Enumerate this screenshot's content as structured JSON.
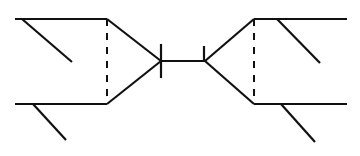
{
  "canvas": {
    "width": 360,
    "height": 156,
    "background": "#ffffff",
    "title": "Feynman diagram: two three-body vertices joined by a tick-marked propagator"
  },
  "style": {
    "line_color": "#111111",
    "solid_stroke_width": 2.2,
    "dashed_stroke_width": 2.0,
    "tick_stroke_width": 2.2,
    "dash_pattern": "7,7"
  },
  "chart_data": {
    "type": "diagram",
    "title": "Feynman diagram: two three-body vertices joined by a tick-marked propagator",
    "xlabel": "",
    "ylabel": "",
    "xlim": [
      0,
      360
    ],
    "ylim": [
      0,
      156
    ],
    "grid": false,
    "legend": "none",
    "elements": [
      {
        "id": "left-top-outer-line",
        "kind": "solid-line",
        "role": "external-leg",
        "x1": 15,
        "y1": 19,
        "x2": 107,
        "y2": 19
      },
      {
        "id": "left-top-branch-line",
        "kind": "solid-line",
        "role": "external-leg-branch",
        "x1": 22,
        "y1": 19,
        "x2": 72,
        "y2": 62
      },
      {
        "id": "left-bottom-outer-line",
        "kind": "solid-line",
        "role": "external-leg",
        "x1": 15,
        "y1": 104,
        "x2": 107,
        "y2": 104
      },
      {
        "id": "left-bottom-branch-line",
        "kind": "solid-line",
        "role": "external-leg-branch",
        "x1": 33,
        "y1": 104,
        "x2": 66,
        "y2": 140
      },
      {
        "id": "left-dashed-line",
        "kind": "dashed-line",
        "role": "internal-exchange",
        "x1": 107,
        "y1": 19,
        "x2": 107,
        "y2": 104
      },
      {
        "id": "left-upper-converging-line",
        "kind": "solid-line",
        "role": "vertex-edge",
        "x1": 107,
        "y1": 19,
        "x2": 161,
        "y2": 61
      },
      {
        "id": "left-lower-converging-line",
        "kind": "solid-line",
        "role": "vertex-edge",
        "x1": 107,
        "y1": 104,
        "x2": 161,
        "y2": 61
      },
      {
        "id": "center-propagator-line",
        "kind": "solid-line",
        "role": "propagator",
        "x1": 160,
        "y1": 61,
        "x2": 205,
        "y2": 61
      },
      {
        "id": "left-tick-mark",
        "kind": "solid-line",
        "role": "tick",
        "x1": 161,
        "y1": 44,
        "x2": 161,
        "y2": 78
      },
      {
        "id": "right-tick-mark",
        "kind": "solid-line",
        "role": "tick",
        "x1": 204,
        "y1": 46,
        "x2": 204,
        "y2": 61
      },
      {
        "id": "right-upper-diverging-line",
        "kind": "solid-line",
        "role": "vertex-edge",
        "x1": 205,
        "y1": 61,
        "x2": 254,
        "y2": 19
      },
      {
        "id": "right-lower-diverging-line",
        "kind": "solid-line",
        "role": "vertex-edge",
        "x1": 205,
        "y1": 61,
        "x2": 254,
        "y2": 104
      },
      {
        "id": "right-dashed-line",
        "kind": "dashed-line",
        "role": "internal-exchange",
        "x1": 254,
        "y1": 19,
        "x2": 254,
        "y2": 104
      },
      {
        "id": "right-top-outer-line",
        "kind": "solid-line",
        "role": "external-leg",
        "x1": 254,
        "y1": 19,
        "x2": 347,
        "y2": 19
      },
      {
        "id": "right-top-branch-line",
        "kind": "solid-line",
        "role": "external-leg-branch",
        "x1": 277,
        "y1": 19,
        "x2": 320,
        "y2": 63
      },
      {
        "id": "right-bottom-outer-line",
        "kind": "solid-line",
        "role": "external-leg",
        "x1": 254,
        "y1": 104,
        "x2": 347,
        "y2": 104
      },
      {
        "id": "right-bottom-branch-line",
        "kind": "solid-line",
        "role": "external-leg-branch",
        "x1": 281,
        "y1": 104,
        "x2": 315,
        "y2": 142
      }
    ]
  }
}
